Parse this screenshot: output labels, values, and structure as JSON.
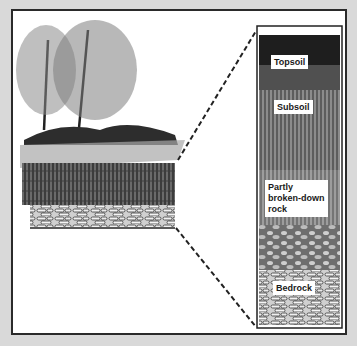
{
  "diagram": {
    "layers": [
      {
        "label": "Topsoil"
      },
      {
        "label": "Subsoil"
      },
      {
        "label": "Partly broken-down rock"
      },
      {
        "label": "Bedrock"
      }
    ],
    "label_lines": {
      "topsoil": "Topsoil",
      "subsoil": "Subsoil",
      "partly_1": "Partly",
      "partly_2": "broken-down",
      "partly_3": "rock",
      "bedrock": "Bedrock"
    },
    "colors": {
      "frame": "#2a2a2a",
      "background": "#ffffff",
      "page": "#d9d9d9",
      "topsoil": "#1e1e1e",
      "subsoil": "#6a6a6a",
      "rock": "#8a8a8a",
      "bedrock": "#b0b0b0"
    }
  }
}
